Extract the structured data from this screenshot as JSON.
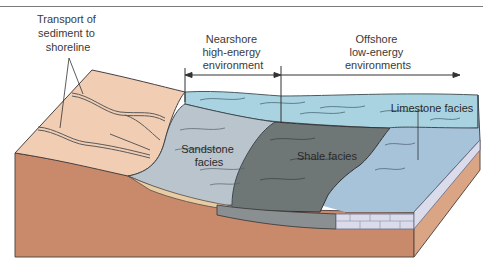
{
  "figure": {
    "labels": {
      "transport": [
        "Transport of",
        "sediment to",
        "shoreline"
      ],
      "nearshore": [
        "Nearshore",
        "high-energy",
        "environment"
      ],
      "offshore": [
        "Offshore",
        "low-energy",
        "environments"
      ],
      "sandstone": [
        "Sandstone",
        "facies"
      ],
      "shale": "Shale facies",
      "limestone": "Limestone facies"
    },
    "colors": {
      "land_top": "#f1cdb3",
      "bedrock": "#c98a6c",
      "bedrock_side": "#d9a585",
      "water": "#a9d3e0",
      "water_deep": "#8ec3d6",
      "sandstone": "#b9c4cc",
      "shale": "#6f7676",
      "limestone": "#a6c3d9",
      "limestone_block": "#dadcec",
      "sand_layer": "#e8cca4",
      "outline": "#3f3f3f"
    }
  }
}
